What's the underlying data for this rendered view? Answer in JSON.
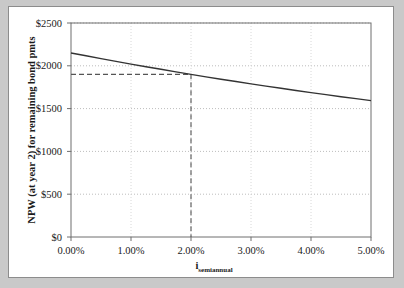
{
  "chart_data": {
    "type": "line",
    "title": "",
    "xlabel": "i_semiannual",
    "xlabel_base": "i",
    "xlabel_subscript": "semiannual",
    "ylabel": "NPW (at year 2) for remaining bond pmts",
    "xlim": [
      0.0,
      5.0
    ],
    "ylim": [
      0,
      2500
    ],
    "x_tick_labels": [
      "0.00%",
      "1.00%",
      "2.00%",
      "3.00%",
      "4.00%",
      "5.00%"
    ],
    "x_tick_values": [
      0.0,
      1.0,
      2.0,
      3.0,
      4.0,
      5.0
    ],
    "y_tick_labels": [
      "$0",
      "$500",
      "$1000",
      "$1500",
      "$2000",
      "$2500"
    ],
    "y_tick_values": [
      0,
      500,
      1000,
      1500,
      2000,
      2500
    ],
    "grid": true,
    "grid_style": "dotted",
    "legend": "none",
    "series": [
      {
        "name": "NPW vs semiannual interest rate",
        "color": "#333333",
        "x": [
          0.0,
          0.25,
          0.5,
          0.75,
          1.0,
          1.25,
          1.5,
          1.75,
          2.0,
          2.25,
          2.5,
          2.75,
          3.0,
          3.25,
          3.5,
          3.75,
          4.0,
          4.25,
          4.5,
          4.75,
          5.0
        ],
        "values": [
          2150,
          2117,
          2084,
          2052,
          2020,
          1989,
          1959,
          1929,
          1900,
          1871,
          1843,
          1816,
          1789,
          1763,
          1737,
          1712,
          1687,
          1663,
          1639,
          1616,
          1593
        ]
      }
    ],
    "annotations": [
      {
        "name": "reference-lines",
        "type": "crosshair-dashed",
        "x": 2.0,
        "y": 1900,
        "color": "#555555",
        "style": "dashed"
      }
    ]
  }
}
